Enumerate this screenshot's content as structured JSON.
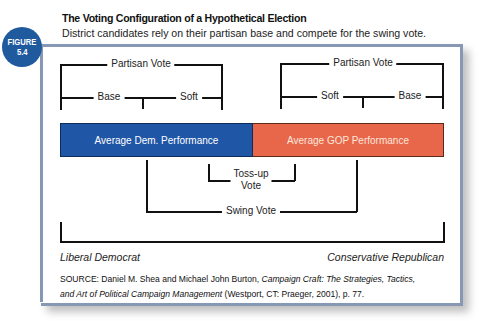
{
  "figure": {
    "badge_label": "FIGURE",
    "badge_number": "5.4",
    "title": "The Voting Configuration of a Hypothetical Election",
    "subtitle": "District candidates rely on their partisan base and compete for the swing vote."
  },
  "diagram": {
    "left_group": {
      "top_label": "Partisan Vote",
      "sub_labels": [
        "Base",
        "Soft"
      ]
    },
    "right_group": {
      "top_label": "Partisan Vote",
      "sub_labels": [
        "Soft",
        "Base"
      ]
    },
    "bars": [
      {
        "label": "Average Dem. Performance",
        "color": "#1f56a5"
      },
      {
        "label": "Average GOP Performance",
        "color": "#e8674a"
      }
    ],
    "tossup_label_line1": "Toss-up",
    "tossup_label_line2": "Vote",
    "swing_label": "Swing Vote",
    "axis_left": "Liberal Democrat",
    "axis_right": "Conservative Republican"
  },
  "source": {
    "prefix": "SOURCE: Daniel M. Shea and Michael John Burton, ",
    "title_part1": "Campaign Craft: The Strategies, Tactics,",
    "title_part2": "and Art of Political Campaign Management",
    "suffix": " (Westport, CT: Praeger, 2001), p. 77."
  },
  "colors": {
    "badge": "#1f5a9e",
    "frame": "#8698b4",
    "dem": "#1f56a5",
    "gop": "#e8674a"
  }
}
